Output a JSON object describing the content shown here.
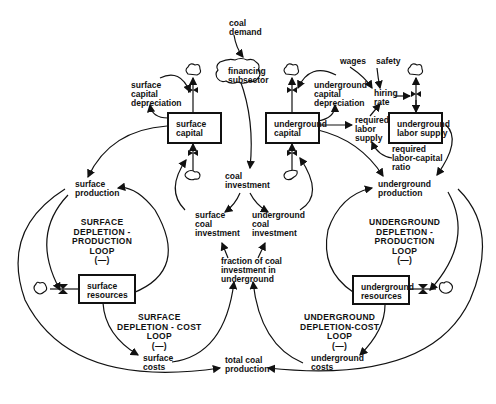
{
  "diagram": {
    "type": "system-dynamics stock-flow diagram",
    "stocks": {
      "surface_capital": "surface\ncapital",
      "underground_capital": "underground\ncapital",
      "underground_labor_supply": "underground\nlabor supply",
      "surface_resources": "surface\nresources",
      "underground_resources": "underground\nresources"
    },
    "clouds": {
      "financing_subsector": "financing\nsubsector"
    },
    "variables": {
      "coal_demand": "coal\ndemand",
      "surface_capital_depreciation": "surface\ncapital\ndepreciation",
      "underground_capital_depreciation": "underground\ncapital\ndepreciation",
      "wages": "wages",
      "safety": "safety",
      "hiring_rate": "hiring\nrate",
      "required_labor_supply": "required\nlabor\nsupply",
      "required_labor_capital_ratio": "required\nlabor-capital\nratio",
      "coal_investment": "coal\ninvestment",
      "surface_production": "surface\nproduction",
      "underground_production": "underground\nproduction",
      "surface_coal_investment": "surface\ncoal\ninvestment",
      "underground_coal_investment": "underground\ncoal\ninvestment",
      "fraction_underground": "fraction of coal\ninvestment in\nunderground",
      "surface_costs": "surface\ncosts",
      "underground_costs": "underground\ncosts",
      "total_coal_production": "total coal\nproduction"
    },
    "loops": {
      "surface_depletion_production": "SURFACE\nDEPLETION -\nPRODUCTION\nLOOP\n(—)",
      "surface_depletion_cost": "SURFACE\nDEPLETION - COST\nLOOP\n(—)",
      "underground_depletion_production": "UNDERGROUND\nDEPLETION -\nPRODUCTION\nLOOP\n(—)",
      "underground_depletion_cost": "UNDERGROUND\nDEPLETION-COST\nLOOP\n(—)"
    }
  }
}
